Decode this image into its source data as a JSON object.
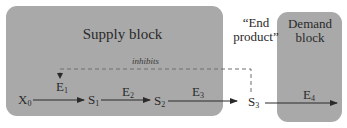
{
  "blocks": {
    "supply": {
      "label": "Supply block"
    },
    "end_product": {
      "line1": "“End",
      "line2": "product”"
    },
    "demand": {
      "line1": "Demand",
      "line2": "block"
    }
  },
  "feedback": {
    "label": "inhibits",
    "style": "dashed"
  },
  "nodes": [
    {
      "id": "X0",
      "base": "X",
      "sub": "0"
    },
    {
      "id": "S1",
      "base": "S",
      "sub": "1"
    },
    {
      "id": "S2",
      "base": "S",
      "sub": "2"
    },
    {
      "id": "S3",
      "base": "S",
      "sub": "3"
    }
  ],
  "enzymes": [
    {
      "id": "E1",
      "base": "E",
      "sub": "1"
    },
    {
      "id": "E2",
      "base": "E",
      "sub": "2"
    },
    {
      "id": "E3",
      "base": "E",
      "sub": "3"
    },
    {
      "id": "E4",
      "base": "E",
      "sub": "4"
    }
  ],
  "colors": {
    "block_fill": "#a9a9a9",
    "text": "#2a2a2a",
    "arrow": "#2a2a2a",
    "dashed": "#6f6f6f"
  }
}
